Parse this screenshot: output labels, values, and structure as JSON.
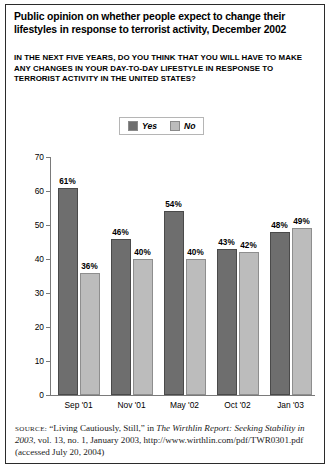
{
  "title": "Public opinion on whether people expect to change their lifestyles in response to terrorist activity, December 2002",
  "subtitle": "IN THE NEXT FIVE YEARS, DO YOU THINK THAT YOU WILL HAVE TO MAKE ANY CHANGES IN YOUR DAY-TO-DAY LIFESTYLE IN RESPONSE TO TERRORIST ACTIVITY IN THE UNITED STATES?",
  "legend": {
    "yes_label": "Yes",
    "no_label": "No",
    "yes_color": "#6e6e6e",
    "no_color": "#bcbcbc"
  },
  "source": {
    "prefix": "SOURCE:",
    "line1_a": " “Living Cautiously, Still,” in ",
    "italic1": "The Wirthlin Report: Seeking Stability in 2003",
    "line1_b": ", vol. 13, no. 1, January 2003, http://www.wirthlin.com/pdf/TWR0301.pdf (accessed July 20, 2004)"
  },
  "chart_data": {
    "type": "bar",
    "title": "Public opinion on whether people expect to change their lifestyles in response to terrorist activity, December 2002",
    "subtitle": "IN THE NEXT FIVE YEARS, DO YOU THINK THAT YOU WILL HAVE TO MAKE ANY CHANGES IN YOUR DAY-TO-DAY LIFESTYLE IN RESPONSE TO TERRORIST ACTIVITY IN THE UNITED STATES?",
    "categories": [
      "Sep '01",
      "Nov '01",
      "May '02",
      "Oct '02",
      "Jan '03"
    ],
    "series": [
      {
        "name": "Yes",
        "values": [
          61,
          46,
          54,
          43,
          48
        ],
        "labels": [
          "61%",
          "46%",
          "54%",
          "43%",
          "48%"
        ],
        "color": "#6e6e6e"
      },
      {
        "name": "No",
        "values": [
          36,
          40,
          40,
          42,
          49
        ],
        "labels": [
          "36%",
          "40%",
          "40%",
          "42%",
          "49%"
        ],
        "color": "#bcbcbc"
      }
    ],
    "xlabel": "",
    "ylabel": "",
    "ylim": [
      0,
      70
    ],
    "yticks": [
      0,
      10,
      20,
      30,
      40,
      50,
      60,
      70
    ],
    "ytick_labels": [
      "0",
      "10",
      "20",
      "30",
      "40",
      "50",
      "60",
      "70"
    ],
    "grid": false,
    "legend_position": "top-center"
  }
}
